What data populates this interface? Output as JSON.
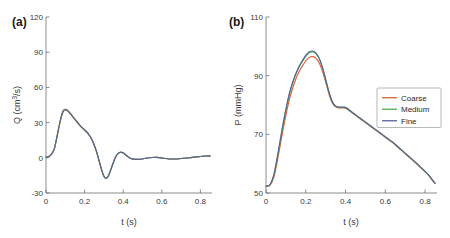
{
  "figure": {
    "panels": [
      {
        "tag": "(a)",
        "xlabel": "t (s)",
        "ylabel_parts": {
          "main": "Q (cm",
          "sup": "3",
          "tail": "/s)"
        },
        "ylabel_plain": "Q (cm3/s)"
      },
      {
        "tag": "(b)",
        "xlabel": "t (s)",
        "ylabel_parts": {
          "main": "P (mmHg)",
          "sup": "",
          "tail": ""
        },
        "ylabel_plain": "P (mmHg)"
      }
    ]
  },
  "colors": {
    "coarse": "#D9603A",
    "medium": "#4FAE50",
    "fine": "#5B6298",
    "axis": "#6f6f6f",
    "text": "#3a3a3a",
    "background": "#ffffff"
  },
  "legend": {
    "position": "center-right",
    "entries": [
      {
        "label": "Coarse",
        "color": "#D9603A"
      },
      {
        "label": "Medium",
        "color": "#4FAE50"
      },
      {
        "label": "Fine",
        "color": "#5B6298"
      }
    ]
  },
  "chart_data": [
    {
      "type": "line",
      "title": "(a)",
      "xlabel": "t (s)",
      "ylabel": "Q (cm^3/s)",
      "xlim": [
        0,
        0.86
      ],
      "ylim": [
        -30,
        120
      ],
      "xticks": [
        0,
        0.2,
        0.4,
        0.6,
        0.8
      ],
      "xticklabels": [
        "0",
        "0.2",
        "0.4",
        "0.6",
        "0.8"
      ],
      "yticks": [
        -30,
        0,
        30,
        60,
        90,
        120
      ],
      "yticklabels": [
        "-30",
        "0",
        "30",
        "60",
        "90",
        "120"
      ],
      "grid": false,
      "legend": false,
      "x": [
        0,
        0.02,
        0.04,
        0.05,
        0.06,
        0.07,
        0.08,
        0.09,
        0.1,
        0.11,
        0.12,
        0.13,
        0.14,
        0.15,
        0.16,
        0.17,
        0.18,
        0.19,
        0.2,
        0.21,
        0.22,
        0.23,
        0.24,
        0.25,
        0.26,
        0.27,
        0.28,
        0.29,
        0.3,
        0.31,
        0.32,
        0.33,
        0.34,
        0.35,
        0.36,
        0.37,
        0.38,
        0.39,
        0.4,
        0.41,
        0.42,
        0.43,
        0.44,
        0.45,
        0.47,
        0.49,
        0.51,
        0.53,
        0.55,
        0.57,
        0.59,
        0.61,
        0.63,
        0.65,
        0.67,
        0.69,
        0.71,
        0.73,
        0.75,
        0.77,
        0.79,
        0.81,
        0.83,
        0.85
      ],
      "series": [
        {
          "name": "Coarse",
          "color": "#D9603A",
          "values": [
            0.5,
            1.5,
            6,
            12,
            20,
            28,
            35,
            39.5,
            40.5,
            40,
            38.5,
            36.5,
            34.5,
            32.5,
            30.5,
            28.5,
            26.5,
            25,
            23.5,
            22,
            20,
            17.5,
            14.5,
            10.5,
            6,
            0.5,
            -5.5,
            -11,
            -15.5,
            -17,
            -16,
            -12.5,
            -8,
            -3.5,
            0.5,
            3,
            4.3,
            4.6,
            4,
            2.8,
            1.4,
            0.2,
            -0.6,
            -1.1,
            -1.4,
            -1.2,
            -0.6,
            0,
            0.3,
            0.4,
            0.1,
            -0.4,
            -0.8,
            -1,
            -1,
            -0.8,
            -0.5,
            -0.2,
            0.2,
            0.6,
            1,
            1.3,
            1.5,
            1.6
          ]
        },
        {
          "name": "Medium",
          "color": "#4FAE50",
          "values": [
            0.5,
            1.6,
            6.3,
            12.5,
            20.6,
            28.6,
            35.6,
            40.1,
            41,
            40.4,
            38.9,
            36.9,
            34.8,
            32.8,
            30.8,
            28.8,
            26.8,
            25.2,
            23.7,
            22.2,
            20.2,
            17.7,
            14.7,
            10.7,
            6.2,
            0.6,
            -5.6,
            -11.2,
            -15.8,
            -17.3,
            -16.3,
            -12.7,
            -8.1,
            -3.6,
            0.5,
            3.1,
            4.4,
            4.7,
            4.1,
            2.9,
            1.5,
            0.25,
            -0.6,
            -1.1,
            -1.4,
            -1.2,
            -0.6,
            0,
            0.3,
            0.4,
            0.1,
            -0.4,
            -0.8,
            -1,
            -1,
            -0.8,
            -0.5,
            -0.2,
            0.2,
            0.6,
            1,
            1.3,
            1.5,
            1.6
          ]
        },
        {
          "name": "Fine",
          "color": "#5B6298",
          "values": [
            0.5,
            1.6,
            6.4,
            12.7,
            20.9,
            29,
            36,
            40.5,
            41.4,
            40.8,
            39.2,
            37.2,
            35,
            33,
            31,
            29,
            27,
            25.4,
            23.9,
            22.4,
            20.4,
            17.9,
            14.9,
            10.8,
            6.3,
            0.6,
            -5.7,
            -11.3,
            -16,
            -17.5,
            -16.5,
            -12.9,
            -8.2,
            -3.6,
            0.5,
            3.1,
            4.5,
            4.8,
            4.2,
            3,
            1.5,
            0.3,
            -0.6,
            -1.1,
            -1.4,
            -1.2,
            -0.6,
            0,
            0.3,
            0.4,
            0.1,
            -0.4,
            -0.8,
            -1,
            -1,
            -0.8,
            -0.5,
            -0.2,
            0.2,
            0.6,
            1,
            1.3,
            1.5,
            1.6
          ]
        }
      ]
    },
    {
      "type": "line",
      "title": "(b)",
      "xlabel": "t (s)",
      "ylabel": "P (mmHg)",
      "xlim": [
        0,
        0.86
      ],
      "ylim": [
        50,
        110
      ],
      "xticks": [
        0,
        0.2,
        0.4,
        0.6,
        0.8
      ],
      "xticklabels": [
        "0",
        "0.2",
        "0.4",
        "0.6",
        "0.8"
      ],
      "yticks": [
        50,
        70,
        90,
        110
      ],
      "yticklabels": [
        "50",
        "70",
        "90",
        "110"
      ],
      "grid": false,
      "legend": true,
      "x": [
        0,
        0.02,
        0.04,
        0.06,
        0.08,
        0.1,
        0.12,
        0.14,
        0.16,
        0.18,
        0.2,
        0.21,
        0.22,
        0.23,
        0.24,
        0.25,
        0.26,
        0.27,
        0.28,
        0.29,
        0.3,
        0.31,
        0.32,
        0.33,
        0.34,
        0.35,
        0.36,
        0.37,
        0.38,
        0.39,
        0.4,
        0.41,
        0.42,
        0.44,
        0.46,
        0.48,
        0.5,
        0.52,
        0.54,
        0.56,
        0.58,
        0.6,
        0.62,
        0.64,
        0.66,
        0.68,
        0.7,
        0.72,
        0.74,
        0.76,
        0.78,
        0.8,
        0.82,
        0.84,
        0.85
      ],
      "series": [
        {
          "name": "Coarse",
          "color": "#D9603A",
          "values": [
            52.2,
            52.6,
            55.5,
            62,
            69.5,
            76.5,
            82.5,
            87,
            90.5,
            93,
            95,
            95.8,
            96.3,
            96.5,
            96.4,
            96,
            95.2,
            94,
            92.3,
            90.2,
            87.8,
            85.3,
            83,
            81.2,
            80,
            79.4,
            79.1,
            79,
            79,
            79,
            78.9,
            78.5,
            78,
            77,
            76,
            75,
            74,
            73,
            72,
            71,
            70,
            69,
            68,
            67,
            65.8,
            64.6,
            63.4,
            62.2,
            61,
            59.8,
            58.5,
            57.2,
            55.8,
            54,
            53.2
          ]
        },
        {
          "name": "Medium",
          "color": "#4FAE50",
          "values": [
            52.3,
            52.8,
            56.2,
            63.2,
            71,
            78.2,
            84.2,
            88.6,
            92,
            94.5,
            96.6,
            97.4,
            97.9,
            98.1,
            98,
            97.6,
            96.7,
            95.4,
            93.6,
            91.3,
            88.7,
            86,
            83.6,
            81.6,
            80.3,
            79.6,
            79.3,
            79.2,
            79.2,
            79.2,
            79.1,
            78.7,
            78.1,
            77.1,
            76.1,
            75.1,
            74.1,
            73.1,
            72.1,
            71.1,
            70.1,
            69.1,
            68.1,
            67.1,
            65.9,
            64.7,
            63.5,
            62.3,
            61.1,
            59.9,
            58.6,
            57.3,
            55.9,
            54.1,
            53.3
          ]
        },
        {
          "name": "Fine",
          "color": "#5B6298",
          "values": [
            52.3,
            52.9,
            56.4,
            63.5,
            71.4,
            78.6,
            84.6,
            89,
            92.3,
            94.8,
            96.9,
            97.7,
            98.2,
            98.4,
            98.3,
            97.8,
            96.9,
            95.5,
            93.7,
            91.4,
            88.8,
            86.1,
            83.7,
            81.7,
            80.4,
            79.7,
            79.4,
            79.3,
            79.3,
            79.3,
            79.2,
            78.8,
            78.2,
            77.2,
            76.2,
            75.2,
            74.2,
            73.2,
            72.2,
            71.2,
            70.2,
            69.2,
            68.2,
            67.2,
            66,
            64.8,
            63.6,
            62.4,
            61.2,
            60,
            58.7,
            57.4,
            56,
            54.2,
            53.4
          ]
        }
      ]
    }
  ]
}
